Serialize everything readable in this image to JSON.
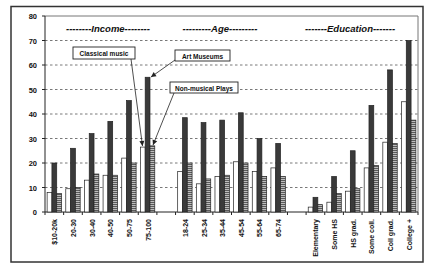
{
  "chart_data": {
    "type": "bar",
    "title": "",
    "xlabel": "",
    "ylabel": "",
    "ylim": [
      0,
      80
    ],
    "yticks": [
      0,
      10,
      20,
      30,
      40,
      50,
      60,
      70,
      80
    ],
    "grid": "horizontal dashed",
    "groups": [
      {
        "name": "--------Income--------",
        "categories": [
          "$10-20k",
          "20-30",
          "30-40",
          "40-50",
          "50-75",
          "75-100"
        ]
      },
      {
        "name": "---------Age---------",
        "categories": [
          "18-24",
          "25-34",
          "35-44",
          "45-54",
          "55-64",
          "65-74"
        ]
      },
      {
        "name": "-------Education-------",
        "categories": [
          "Elementary",
          "Some HS",
          "HS grad.",
          "Some coll.",
          "Coll grad.",
          "College +"
        ]
      }
    ],
    "categories": [
      "$10-20k",
      "20-30",
      "30-40",
      "40-50",
      "50-75",
      "75-100",
      "18-24",
      "25-34",
      "35-44",
      "45-54",
      "55-64",
      "65-74",
      "Elementary",
      "Some HS",
      "HS grad.",
      "Some coll.",
      "Coll grad.",
      "College +"
    ],
    "series": [
      {
        "name": "Classical music",
        "style": "white",
        "values": [
          8,
          9.5,
          13,
          15,
          22,
          26.5,
          16.5,
          11.5,
          14.5,
          20.5,
          16.5,
          18,
          2,
          4,
          8.5,
          18,
          28.5,
          45
        ]
      },
      {
        "name": "Art Museums",
        "style": "dark",
        "values": [
          20,
          26,
          32,
          37,
          45.5,
          55,
          38.5,
          36.5,
          37.5,
          40.5,
          30,
          28,
          6,
          14.5,
          25,
          43.5,
          58,
          70
        ]
      },
      {
        "name": "Non-musical Plays",
        "style": "hatched",
        "values": [
          7.5,
          10,
          15.5,
          15,
          20,
          27,
          20,
          13.5,
          15,
          20,
          14.5,
          14.5,
          3,
          7.5,
          9.5,
          19,
          28,
          37.5
        ]
      }
    ],
    "annotations": [
      {
        "text": "Classical music",
        "points_to": "75-100 Classical music"
      },
      {
        "text": "Art Museums",
        "points_to": "75-100 Art Museums"
      },
      {
        "text": "Non-musical Plays",
        "points_to": "75-100 Non-musical Plays"
      }
    ],
    "colors": {
      "white": "#ffffff",
      "dark": "#3a3a3a",
      "hatched": "#9a9a9a",
      "grid": "#555555",
      "frame": "#333333"
    }
  }
}
